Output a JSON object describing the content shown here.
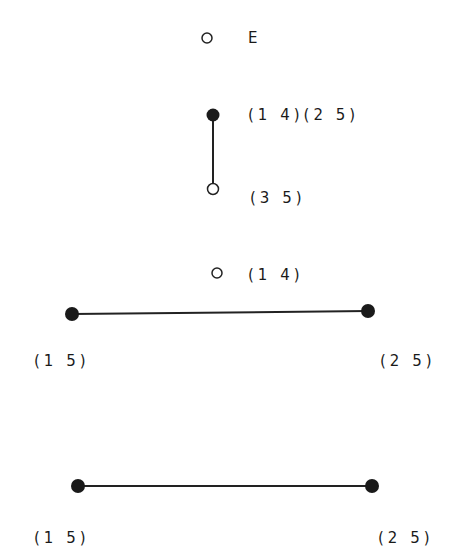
{
  "diagram": {
    "graphs": [
      {
        "name": "graph-E",
        "nodes": [
          {
            "id": "E",
            "label": "E",
            "filled": false
          }
        ],
        "edges": []
      },
      {
        "name": "graph-vertical",
        "nodes": [
          {
            "id": "top",
            "label": "(1 4)(2 5)",
            "filled": true
          },
          {
            "id": "bottom",
            "label": "(3 5)",
            "filled": false
          }
        ],
        "edges": [
          [
            "top",
            "bottom"
          ]
        ]
      },
      {
        "name": "graph-third",
        "nodes": [
          {
            "id": "iso",
            "label": "(1 4)",
            "filled": false
          },
          {
            "id": "left",
            "label": "(1 5)",
            "filled": true
          },
          {
            "id": "right",
            "label": "(2 5)",
            "filled": true
          }
        ],
        "edges": [
          [
            "left",
            "right"
          ]
        ]
      },
      {
        "name": "graph-bottom",
        "nodes": [
          {
            "id": "left",
            "label": "(1 5)",
            "filled": true
          },
          {
            "id": "right",
            "label": "(2 5)",
            "filled": true
          }
        ],
        "edges": [
          [
            "left",
            "right"
          ]
        ]
      }
    ],
    "labels": {
      "e": "E",
      "v_top": "(1 4)(2 5)",
      "v_bottom": "(3 5)",
      "iso": "(1 4)",
      "g3_left": "(1 5)",
      "g3_right": "(2 5)",
      "g4_left": "(1 5)",
      "g4_right": "(2 5)"
    }
  }
}
